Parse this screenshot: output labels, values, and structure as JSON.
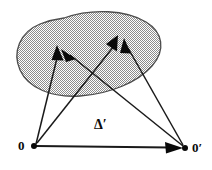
{
  "figure": {
    "background_color": "#ffffff",
    "stroke_color": "#1a1a1a",
    "region": {
      "name": "shaded-region",
      "fill_color": "#b3b3b3",
      "fill_pattern": "checkered-dots",
      "outline_color": "#4d4d4d"
    },
    "labels": {
      "origin": "0",
      "origin_prime": "0′",
      "delta_prime": "Δ′"
    },
    "points": [
      {
        "name": "origin",
        "label": "0",
        "x": 34,
        "y": 146
      },
      {
        "name": "origin-prime",
        "label": "0′",
        "x": 185,
        "y": 148
      },
      {
        "name": "target-left",
        "label": "",
        "x": 57,
        "y": 46
      },
      {
        "name": "target-right",
        "label": "",
        "x": 118,
        "y": 36
      }
    ],
    "vectors": [
      {
        "name": "origin-to-target-left",
        "from": "origin",
        "to": "target-left",
        "x1": 36,
        "y1": 144,
        "x2": 57,
        "y2": 46
      },
      {
        "name": "origin-to-target-right",
        "from": "origin",
        "to": "target-right",
        "x1": 37,
        "y1": 143,
        "x2": 118,
        "y2": 36
      },
      {
        "name": "origin-prime-to-target-left",
        "from": "origin-prime",
        "to": "target-left",
        "x1": 183,
        "y1": 146,
        "x2": 62,
        "y2": 52
      },
      {
        "name": "origin-prime-to-target-right",
        "from": "origin-prime",
        "to": "target-right",
        "x1": 183,
        "y1": 145,
        "x2": 124,
        "y2": 38
      },
      {
        "name": "origin-to-origin-prime",
        "from": "origin",
        "to": "origin-prime",
        "x1": 36,
        "y1": 146,
        "x2": 182,
        "y2": 148
      }
    ]
  }
}
